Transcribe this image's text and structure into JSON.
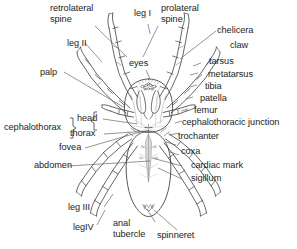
{
  "figure": {
    "type": "labeled-line-drawing",
    "background_color": "#ffffff",
    "ink_color": "#3a3a3a",
    "text_color": "#1d1d1b"
  },
  "labels": {
    "retrolateral_spine": "retrolateral\nspine",
    "leg_i": "leg I",
    "prolateral_spine": "prolateral\nspine",
    "chelicera": "chelicera",
    "leg_ii": "leg II",
    "claw": "claw",
    "palp": "palp",
    "eyes": "eyes",
    "tarsus": "tarsus",
    "metatarsus": "metatarsus",
    "tibia": "tibia",
    "patella": "patella",
    "cephalothorax": "cephalothorax",
    "head": "head",
    "femur": "femur",
    "thorax": "thorax",
    "cephalothoracic_junction": "cephalothoracic junction",
    "trochanter": "trochanter",
    "fovea": "fovea",
    "coxa": "coxa",
    "abdomen": "abdomen",
    "cardiac_mark": "cardiac mark",
    "sigillum": "sigillum",
    "leg_iii": "leg III",
    "leg_iv": "legIV",
    "anal_tubercle": "anal\ntubercle",
    "spinneret": "spinneret"
  }
}
